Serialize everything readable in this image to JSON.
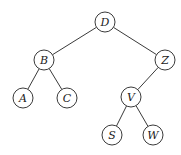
{
  "diagram": {
    "type": "binary-tree",
    "node_radius": 10,
    "nodes": [
      {
        "id": "D",
        "label": "D",
        "x": 105,
        "y": 22
      },
      {
        "id": "B",
        "label": "B",
        "x": 44,
        "y": 60
      },
      {
        "id": "Z",
        "label": "Z",
        "x": 165,
        "y": 60
      },
      {
        "id": "A",
        "label": "A",
        "x": 23,
        "y": 98
      },
      {
        "id": "C",
        "label": "C",
        "x": 67,
        "y": 98
      },
      {
        "id": "V",
        "label": "V",
        "x": 131,
        "y": 97
      },
      {
        "id": "S",
        "label": "S",
        "x": 112,
        "y": 135
      },
      {
        "id": "W",
        "label": "W",
        "x": 153,
        "y": 135
      }
    ],
    "edges": [
      {
        "from": "D",
        "to": "B"
      },
      {
        "from": "D",
        "to": "Z"
      },
      {
        "from": "B",
        "to": "A"
      },
      {
        "from": "B",
        "to": "C"
      },
      {
        "from": "Z",
        "to": "V"
      },
      {
        "from": "V",
        "to": "S"
      },
      {
        "from": "V",
        "to": "W"
      }
    ]
  }
}
